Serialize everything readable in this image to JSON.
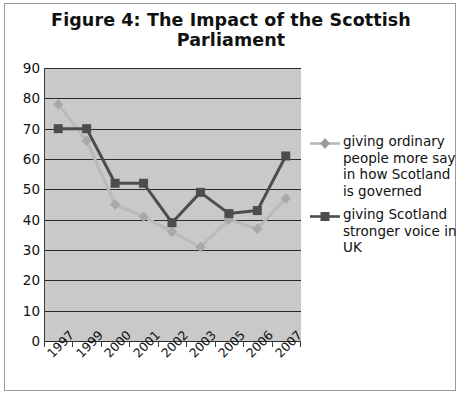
{
  "figure": {
    "title": "Figure 4: The Impact of the Scottish Parliament"
  },
  "chart_data": {
    "type": "line",
    "title": "Figure 4: The Impact of the Scottish Parliament",
    "xlabel": "",
    "ylabel": "",
    "ylim": [
      0,
      90
    ],
    "yticks": [
      "0",
      "10",
      "20",
      "30",
      "40",
      "50",
      "60",
      "70",
      "80",
      "90"
    ],
    "grid": true,
    "legend_position": "right",
    "categories": [
      "1997",
      "1999",
      "2000",
      "2001",
      "2002",
      "2003",
      "2005",
      "2006",
      "2007"
    ],
    "series": [
      {
        "name": "giving ordinary people more say in how Scotland is governed",
        "marker": "diamond",
        "color": "#b9b9b9",
        "values": [
          78,
          66,
          45,
          41,
          36,
          31,
          40,
          37,
          47
        ]
      },
      {
        "name": "giving Scotland stronger voice in UK",
        "marker": "square",
        "color": "#4d4d4d",
        "values": [
          70,
          70,
          52,
          52,
          39,
          49,
          42,
          43,
          61
        ]
      }
    ]
  },
  "legend": {
    "items": [
      {
        "label": "giving ordinary people more say in how Scotland is governed"
      },
      {
        "label": "giving Scotland stronger voice in UK"
      }
    ]
  },
  "colors": {
    "plot_background": "#c9c9c9",
    "gridline": "#2b2b2b",
    "series_light": "#b9b9b9",
    "series_dark": "#4d4d4d",
    "page_background": "#ffffff",
    "text": "#111111"
  }
}
